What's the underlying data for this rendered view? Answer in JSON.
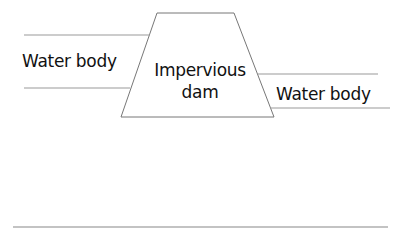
{
  "diagram": {
    "dam": {
      "label_line1": "Impervious",
      "label_line2": "dam"
    },
    "left_water": {
      "label": "Water body"
    },
    "right_water": {
      "label": "Water body"
    },
    "colors": {
      "line": "#888888",
      "text": "#111111",
      "background": "#ffffff"
    }
  }
}
